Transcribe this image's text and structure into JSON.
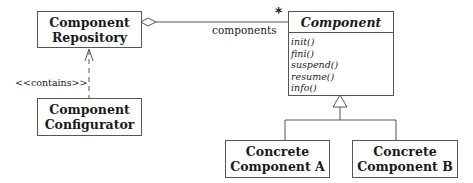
{
  "diagram": {
    "type": "UML class diagram",
    "classes": {
      "repository": {
        "line1": "Component",
        "line2": "Repository"
      },
      "configurator": {
        "line1": "Component",
        "line2": "Configurator"
      },
      "component": {
        "name": "Component",
        "abstract": true,
        "operations": [
          "init()",
          "fini()",
          "suspend()",
          "resume()",
          "info()"
        ]
      },
      "concrete_a": {
        "line1": "Concrete",
        "line2": "Component A"
      },
      "concrete_b": {
        "line1": "Concrete",
        "line2": "Component B"
      }
    },
    "relationships": {
      "aggregation": {
        "from": "Component Repository",
        "to": "Component",
        "role": "components",
        "multiplicity": "*"
      },
      "dependency": {
        "from": "Component Configurator",
        "to": "Component Repository",
        "stereotype": "<<contains>>"
      },
      "generalization": {
        "parent": "Component",
        "children": [
          "Concrete Component A",
          "Concrete Component B"
        ]
      }
    },
    "colors": {
      "line": "#555555",
      "text": "#1a1a1a",
      "background": "#ffffff"
    }
  }
}
